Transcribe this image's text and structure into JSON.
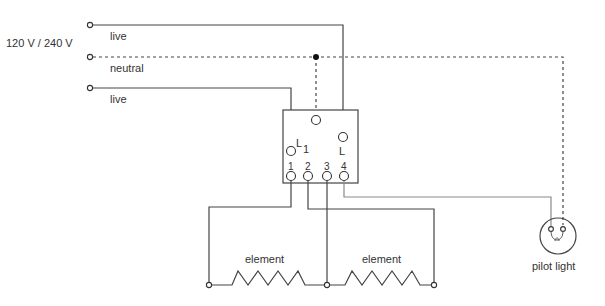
{
  "diagram": {
    "supply_label": "120 V / 240 V",
    "wires": {
      "live_top": "live",
      "neutral": "neutral",
      "live_bottom": "live"
    },
    "switch": {
      "terminal_L1": "L",
      "terminal_L1_sub": "1",
      "terminal_L": "L",
      "terminals": [
        "1",
        "2",
        "3",
        "4"
      ]
    },
    "elements": {
      "left": "element",
      "right": "element"
    },
    "pilot_light": "pilot light"
  }
}
